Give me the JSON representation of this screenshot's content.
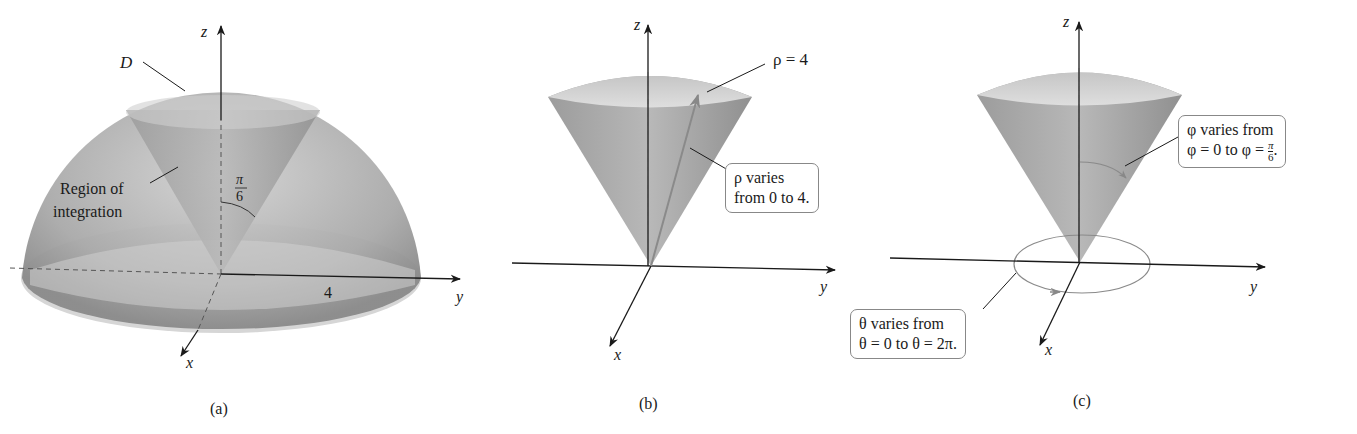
{
  "panels": [
    {
      "id": "a",
      "caption": "(a)",
      "labels": {
        "z_axis": "z",
        "y_axis": "y",
        "x_axis": "x",
        "region_name": "D",
        "region_note_line1": "Region of",
        "region_note_line2": "integration",
        "angle_num": "π",
        "angle_den": "6",
        "radius": "4"
      }
    },
    {
      "id": "b",
      "caption": "(b)",
      "labels": {
        "z_axis": "z",
        "y_axis": "y",
        "x_axis": "x",
        "sphere_label": "ρ = 4",
        "callout_line1": "ρ varies",
        "callout_line2": "from 0 to 4."
      }
    },
    {
      "id": "c",
      "caption": "(c)",
      "labels": {
        "z_axis": "z",
        "y_axis": "y",
        "x_axis": "x",
        "phi_line1": "φ varies from",
        "phi_line2": "φ = 0 to φ = ",
        "phi_frac_num": "π",
        "phi_frac_den": "6",
        "theta_line1": "θ varies from",
        "theta_line2": "θ = 0 to θ = 2π."
      }
    }
  ],
  "colors": {
    "surface_dark": "#8f8f8f",
    "surface_light": "#d9d9d9",
    "axis": "#1a1a1a",
    "callout_border": "#888888"
  }
}
